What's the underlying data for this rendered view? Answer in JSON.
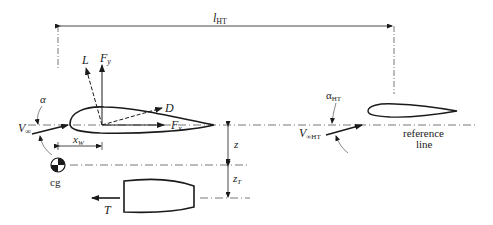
{
  "diagram": {
    "type": "aircraft longitudinal force diagram",
    "labels": {
      "l_ht": {
        "main": "l",
        "sub": "HT"
      },
      "L": "L",
      "Fy": {
        "main": "F",
        "sub": "y"
      },
      "D": "D",
      "Fx": {
        "main": "F",
        "sub": "x"
      },
      "alpha": "α",
      "V_inf": {
        "main": "V",
        "sub": "∞"
      },
      "x_W": {
        "main": "x",
        "sub": "W"
      },
      "z": "z",
      "z_T": {
        "main": "z",
        "sub": "T"
      },
      "cg": "cg",
      "T": "T",
      "alpha_HT": {
        "main": "α",
        "sub": "HT"
      },
      "V_inf_HT": {
        "main": "V",
        "sub": "∞HT"
      },
      "reference_line": [
        "reference",
        "line"
      ]
    },
    "colors": {
      "stroke": "#1a1a1a",
      "dash_line": "#555555"
    }
  }
}
